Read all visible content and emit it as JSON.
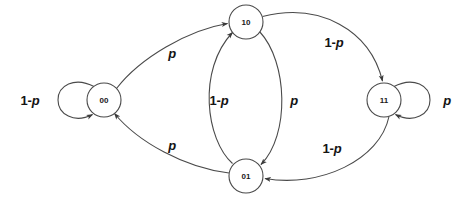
{
  "diagram": {
    "type": "state-transition-diagram",
    "title": "",
    "background_color": "#ffffff",
    "stroke_color": "#4a4a4a",
    "text_color": "#141414",
    "states": [
      {
        "id": "s00",
        "label": "00",
        "cx": 104,
        "cy": 100,
        "r": 17
      },
      {
        "id": "s10",
        "label": "10",
        "cx": 246,
        "cy": 22,
        "r": 17
      },
      {
        "id": "s01",
        "label": "01",
        "cx": 246,
        "cy": 176,
        "r": 17
      },
      {
        "id": "s11",
        "label": "11",
        "cx": 384,
        "cy": 100,
        "r": 17
      }
    ],
    "transitions": [
      {
        "id": "t00-00",
        "from": "00",
        "to": "00",
        "label_num": "1-",
        "label_var": "p",
        "label_x": 30,
        "label_y": 100,
        "kind": "self-loop-left"
      },
      {
        "id": "t00-10",
        "from": "00",
        "to": "10",
        "label_num": "",
        "label_var": "p",
        "label_x": 172,
        "label_y": 53,
        "kind": "curve"
      },
      {
        "id": "t01-10",
        "from": "01",
        "to": "10",
        "label_num": "1-",
        "label_var": "p",
        "label_x": 219,
        "label_y": 100,
        "kind": "curve"
      },
      {
        "id": "t10-01",
        "from": "10",
        "to": "01",
        "label_num": "",
        "label_var": "p",
        "label_x": 294,
        "label_y": 100,
        "kind": "curve"
      },
      {
        "id": "t10-11",
        "from": "10",
        "to": "11",
        "label_num": "1-",
        "label_var": "p",
        "label_x": 334,
        "label_y": 42,
        "kind": "curve"
      },
      {
        "id": "t11-01",
        "from": "11",
        "to": "01",
        "label_num": "1-",
        "label_var": "p",
        "label_x": 332,
        "label_y": 148,
        "kind": "curve"
      },
      {
        "id": "t01-00",
        "from": "01",
        "to": "00",
        "label_num": "",
        "label_var": "p",
        "label_x": 172,
        "label_y": 145,
        "kind": "curve"
      },
      {
        "id": "t11-11",
        "from": "11",
        "to": "11",
        "label_num": "",
        "label_var": "p",
        "label_x": 447,
        "label_y": 100,
        "kind": "self-loop-right"
      }
    ]
  }
}
